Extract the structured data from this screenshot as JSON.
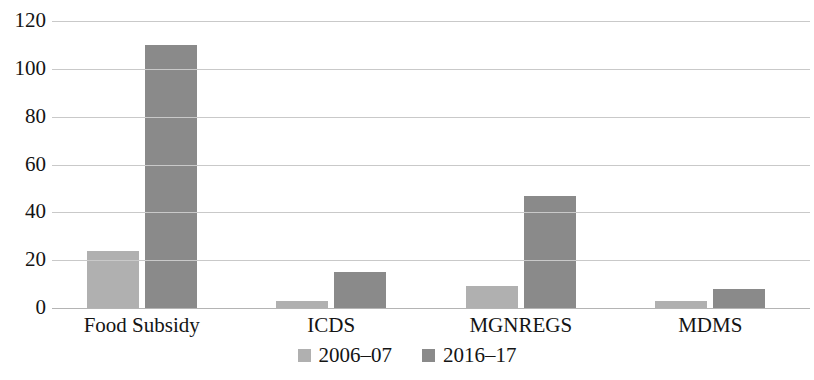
{
  "chart_data": {
    "type": "bar",
    "title": "",
    "subtitle": "",
    "xlabel": "",
    "ylabel": "",
    "categories": [
      "Food Subsidy",
      "ICDS",
      "MGNREGS",
      "MDMS"
    ],
    "series": [
      {
        "name": "2006–07",
        "color": "#b0b0b0",
        "values": [
          24,
          3,
          9,
          3
        ]
      },
      {
        "name": "2016–17",
        "color": "#8a8a8a",
        "values": [
          110,
          15,
          47,
          8
        ]
      }
    ],
    "ylim": [
      0,
      120
    ],
    "yticks": [
      0,
      20,
      40,
      60,
      80,
      100,
      120
    ],
    "ytick_labels": [
      "0",
      "20",
      "40",
      "60",
      "80",
      "100",
      "120"
    ],
    "grid": true,
    "grid_axis": "y",
    "legend": {
      "position": "bottom",
      "entries": [
        "2006–07",
        "2016–17"
      ]
    }
  }
}
